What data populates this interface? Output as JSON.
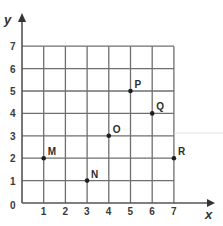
{
  "diagram": {
    "type": "coordinate-grid",
    "axes": {
      "x_label": "x",
      "y_label": "y",
      "x_range": [
        0,
        7
      ],
      "y_range": [
        0,
        7
      ],
      "x_ticks": [
        "1",
        "2",
        "3",
        "4",
        "5",
        "6",
        "7"
      ],
      "y_ticks": [
        "1",
        "2",
        "3",
        "4",
        "5",
        "6",
        "7"
      ],
      "origin_label": "0"
    },
    "points": [
      {
        "label": "M",
        "x": 1,
        "y": 2
      },
      {
        "label": "N",
        "x": 3,
        "y": 1
      },
      {
        "label": "O",
        "x": 4,
        "y": 3
      },
      {
        "label": "P",
        "x": 5,
        "y": 5
      },
      {
        "label": "Q",
        "x": 6,
        "y": 4
      },
      {
        "label": "R",
        "x": 7,
        "y": 2
      }
    ],
    "colors": {
      "grid": "#6f6f6f",
      "axis": "#555555",
      "point": "#1e1e1e",
      "background": "#ffffff"
    }
  }
}
